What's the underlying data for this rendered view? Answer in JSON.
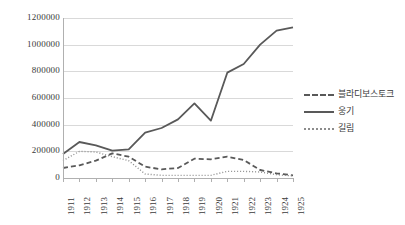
{
  "chart_data": {
    "type": "line",
    "title": "",
    "xlabel": "",
    "ylabel": "",
    "categories": [
      "1911",
      "1912",
      "1913",
      "1914",
      "1915",
      "1916",
      "1917",
      "1918",
      "1919",
      "1920",
      "1921",
      "1922",
      "1923",
      "1924",
      "1925"
    ],
    "ylim": [
      0,
      1200000
    ],
    "ytick_labels": [
      "1200000",
      "1000000",
      "800000",
      "600000",
      "400000",
      "200000",
      "0"
    ],
    "ytick_values": [
      1200000,
      1000000,
      800000,
      600000,
      400000,
      200000,
      0
    ],
    "grid": true,
    "legend_position": "right",
    "series": [
      {
        "name": "블라디보스토크",
        "style": "dashed",
        "color": "#595959",
        "values": [
          75000,
          95000,
          130000,
          185000,
          160000,
          85000,
          65000,
          75000,
          145000,
          140000,
          160000,
          135000,
          60000,
          35000,
          20000
        ]
      },
      {
        "name": "웅기",
        "style": "solid",
        "color": "#595959",
        "values": [
          180000,
          270000,
          245000,
          205000,
          215000,
          340000,
          375000,
          440000,
          560000,
          430000,
          790000,
          855000,
          1000000,
          1105000,
          1130000
        ]
      },
      {
        "name": "길림",
        "style": "dotted",
        "color": "#8c8c8c",
        "values": [
          130000,
          200000,
          195000,
          160000,
          130000,
          30000,
          20000,
          20000,
          20000,
          20000,
          50000,
          50000,
          45000,
          25000,
          15000
        ]
      }
    ]
  }
}
